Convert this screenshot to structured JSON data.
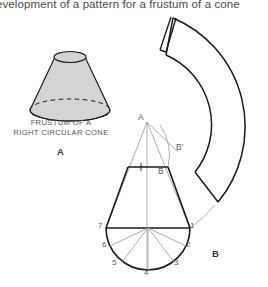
{
  "header": {
    "text": "evelopment of a pattern for a frustum of a cone",
    "clipped_left": true
  },
  "pictorial": {
    "caption_line1": "FRUSTUM OF A",
    "caption_line2": "RIGHT CIRCULAR CONE",
    "figure_letter": "A",
    "fill_color": "#d4d4d4",
    "stroke_color": "#1a1a1a"
  },
  "development": {
    "figure_letter": "B",
    "apex_label": "A",
    "base_label": "B",
    "slant_label": "B'",
    "stroke_color": "#1a1a1a",
    "construction_color": "#9a9a9a"
  },
  "plan": {
    "divisions": [
      "1",
      "2",
      "3",
      "4",
      "5",
      "6",
      "7"
    ],
    "count": 7
  },
  "colors": {
    "background": "#ffffff",
    "ink": "#1a1a1a",
    "light_ink": "#9a9a9a",
    "text": "#555555",
    "header_text": "#3a3a3a"
  }
}
